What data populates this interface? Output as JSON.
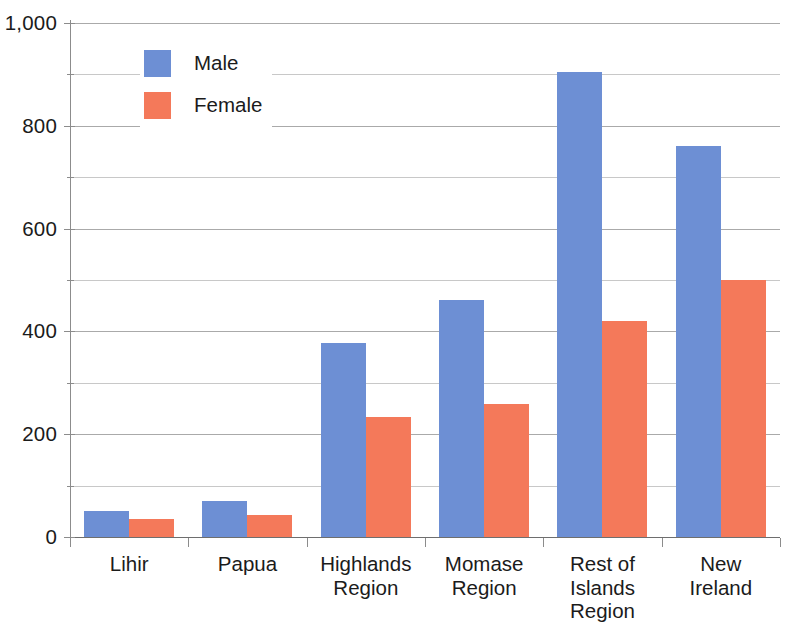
{
  "chart_data": {
    "type": "bar",
    "title": "",
    "subtitle": "",
    "xlabel": "",
    "ylabel": "",
    "categories": [
      "Lihir",
      "Papua",
      "Highlands Region",
      "Momase Region",
      "Rest of Islands Region",
      "New Ireland"
    ],
    "category_lines": [
      [
        "Lihir"
      ],
      [
        "Papua"
      ],
      [
        "Highlands",
        "Region"
      ],
      [
        "Momase",
        "Region"
      ],
      [
        "Rest of",
        "Islands",
        "Region"
      ],
      [
        "New",
        "Ireland"
      ]
    ],
    "series": [
      {
        "name": "Male",
        "color": "#6d8fd4",
        "values": [
          50,
          70,
          378,
          462,
          905,
          760
        ]
      },
      {
        "name": "Female",
        "color": "#f4795a",
        "values": [
          35,
          43,
          233,
          258,
          420,
          500
        ]
      }
    ],
    "ylim": [
      0,
      1000
    ],
    "ytick_labels": [
      "0",
      "200",
      "400",
      "600",
      "800",
      "1,000"
    ],
    "ytick_values": [
      0,
      200,
      400,
      600,
      800,
      1000
    ],
    "yminor_values": [
      100,
      300,
      500,
      700,
      900
    ],
    "grid": true,
    "grid_interval": 100,
    "legend_position": "top-left",
    "legend": [
      {
        "label": "Male",
        "color": "#6d8fd4"
      },
      {
        "label": "Female",
        "color": "#f4795a"
      }
    ]
  },
  "colors": {
    "male": "#6d8fd4",
    "female": "#f4795a",
    "grid": "#9a9a9a",
    "axis": "#8c8c8c",
    "text": "#1b1b1b",
    "background": "#ffffff"
  }
}
